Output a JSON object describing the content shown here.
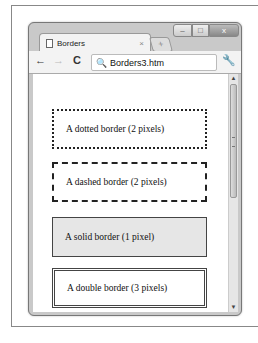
{
  "window": {
    "controls": {
      "minimize": "–",
      "maximize": "□",
      "close": "x"
    },
    "tab": {
      "title": "Borders",
      "close": "×",
      "new_tab": "+"
    },
    "toolbar": {
      "back": "←",
      "forward": "→",
      "reload": "C",
      "address": "Borders3.htm",
      "search_icon": "🔍",
      "wrench": "🔧"
    }
  },
  "page": {
    "boxes": [
      {
        "label": "A dotted border (2 pixels)"
      },
      {
        "label": "A dashed border (2 pixels)"
      },
      {
        "label": "A solid border (1 pixel)"
      },
      {
        "label": "A double border (3 pixels)"
      }
    ]
  },
  "scrollbar": {
    "up": "▲",
    "down": "▼"
  }
}
